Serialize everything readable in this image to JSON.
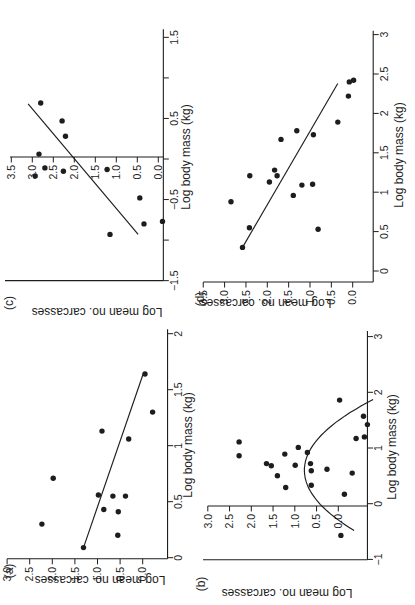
{
  "figure": {
    "background": "#ffffff",
    "ink": "#1d1d1d",
    "panels_order": [
      "a",
      "b",
      "c",
      "d"
    ]
  },
  "chart_data": [
    {
      "id": "a",
      "type": "scatter",
      "panel_label": "(a)",
      "xlabel": "Log body mass (kg)",
      "ylabel": "Log mean no. carcasses",
      "xlim": [
        -0.01,
        2.04
      ],
      "ylim": [
        -0.55,
        3.0
      ],
      "x_axis_at_y": -0.55,
      "y_axis_at_x": -0.01,
      "x_ticks": [
        0,
        0.5,
        1,
        1.5,
        2
      ],
      "x_tick_labels": [
        "0",
        "0.5",
        "1",
        "1.5",
        "2"
      ],
      "y_ticks": [
        0,
        0.5,
        1,
        1.5,
        2,
        2.5,
        3
      ],
      "y_tick_labels": [
        "0.0",
        "0.5",
        "1.0",
        "1.5",
        "2.0",
        "2.5",
        "3.0"
      ],
      "points": [
        [
          1.64,
          -0.05
        ],
        [
          1.3,
          -0.22
        ],
        [
          1.13,
          0.9
        ],
        [
          1.06,
          0.31
        ],
        [
          0.71,
          1.98
        ],
        [
          0.56,
          0.98
        ],
        [
          0.55,
          0.66
        ],
        [
          0.55,
          0.38
        ],
        [
          0.43,
          0.86
        ],
        [
          0.41,
          0.54
        ],
        [
          0.3,
          2.23
        ],
        [
          0.2,
          0.55
        ],
        [
          0.09,
          1.31
        ]
      ],
      "fit": {
        "kind": "line",
        "x1": 0.09,
        "y1": 1.31,
        "x2": 1.64,
        "y2": -0.01
      },
      "cal": {
        "x0": 47.3,
        "xs": 112.0,
        "y0": 142.7,
        "ys": 45.2
      },
      "label_px": [
        34,
        9
      ],
      "xlabel_px": [
        160,
        188
      ],
      "ylabel_px": [
        29,
        100
      ]
    },
    {
      "id": "b",
      "type": "scatter",
      "panel_label": "(b)",
      "xlabel": "Log body mass (kg)",
      "ylabel": "Log mean no. carcasses",
      "xlim": [
        -1.005,
        3.1
      ],
      "ylim": [
        -0.67,
        3.0
      ],
      "x_axis_at_y": -0.67,
      "y_axis_at_x": -0.04,
      "extra_spine": {
        "x": -1.005,
        "y1": -0.67,
        "y2": 3.11
      },
      "x_ticks": [
        -1,
        0,
        1,
        2,
        3
      ],
      "x_tick_labels": [
        "−1",
        "0",
        "1",
        "2",
        "3"
      ],
      "y_ticks": [
        0,
        0.5,
        1,
        1.5,
        2,
        2.5,
        3
      ],
      "y_tick_labels": [
        "0.0",
        "0.5",
        "1.0",
        "1.5",
        "2.0",
        "2.5",
        "3.0"
      ],
      "points": [
        [
          1.86,
          -0.03
        ],
        [
          1.57,
          -0.58
        ],
        [
          1.42,
          -0.67
        ],
        [
          1.2,
          -0.6
        ],
        [
          1.17,
          -0.41
        ],
        [
          1.11,
          2.28
        ],
        [
          0.86,
          2.28
        ],
        [
          1.01,
          0.92
        ],
        [
          0.89,
          1.23
        ],
        [
          0.92,
          0.71
        ],
        [
          0.72,
          1.65
        ],
        [
          0.68,
          1.54
        ],
        [
          0.69,
          0.99
        ],
        [
          0.72,
          0.64
        ],
        [
          0.59,
          0.62
        ],
        [
          0.62,
          0.26
        ],
        [
          0.5,
          1.4
        ],
        [
          0.55,
          -0.32
        ],
        [
          0.33,
          0.62
        ],
        [
          0.29,
          1.21
        ],
        [
          0.17,
          -0.14
        ],
        [
          -0.57,
          -0.06
        ]
      ],
      "fit": {
        "kind": "parabola",
        "qa": -0.98,
        "qh": 0.6,
        "qk": 0.78,
        "x_start": -0.48,
        "x_end": 1.87
      },
      "cal": {
        "x0": 101.3,
        "xs": 55.7,
        "y0": 338.3,
        "ys": 43.5
      },
      "label_px": [
        21,
        201
      ],
      "xlabel_px": [
        158,
        392
      ],
      "ylabel_px": [
        16,
        287
      ]
    },
    {
      "id": "c",
      "type": "scatter",
      "panel_label": "(c)",
      "xlabel": "Log body mass (kg)",
      "ylabel": "Log mean no. carcasses",
      "xlim": [
        -1.5,
        1.6
      ],
      "ylim": [
        -0.12,
        3.53
      ],
      "x_axis_at_y": -0.12,
      "y_axis_at_x": 0.025,
      "extra_spine": {
        "x": -1.5,
        "y1": -0.12,
        "y2": 3.65
      },
      "x_ticks": [
        -1.5,
        -1,
        -0.5,
        0,
        0.5,
        1,
        1.5
      ],
      "x_tick_labels": [
        "−1.5",
        "",
        "−0.5",
        "",
        "0.5",
        "",
        "1.5"
      ],
      "y_ticks": [
        0,
        0.5,
        1,
        1.5,
        2,
        2.5,
        3,
        3.5
      ],
      "y_tick_labels": [
        "0.0",
        "0.5",
        "1.0",
        "1.5",
        "2.0",
        "2.5",
        "3.0",
        "3.5"
      ],
      "points": [
        [
          0.69,
          2.8
        ],
        [
          0.47,
          2.29
        ],
        [
          0.28,
          2.21
        ],
        [
          0.06,
          2.84
        ],
        [
          -0.21,
          2.93
        ],
        [
          -0.11,
          2.7
        ],
        [
          -0.15,
          2.26
        ],
        [
          -0.13,
          1.22
        ],
        [
          -0.48,
          0.44
        ],
        [
          -0.93,
          1.15
        ],
        [
          -0.8,
          0.34
        ],
        [
          -0.77,
          -0.1
        ]
      ],
      "fit": {
        "kind": "line",
        "x1": -0.93,
        "y1": 0.48,
        "x2": 0.68,
        "y2": 3.1
      },
      "cal": {
        "x0": 446.0,
        "xs": 81.1,
        "y0": 158.3,
        "ys": 42.0
      },
      "label_px": [
        302,
        9
      ],
      "xlabel_px": [
        448,
        186
      ],
      "ylabel_px": [
        297,
        97
      ]
    },
    {
      "id": "d",
      "type": "scatter",
      "panel_label": "(d)",
      "xlabel": "Log body mass (kg)",
      "ylabel": "Log mean no. carcasses",
      "xlim": [
        -0.14,
        3.05
      ],
      "ylim": [
        -0.48,
        3.5
      ],
      "x_axis_at_y": -0.48,
      "y_axis_at_x": -0.14,
      "x_ticks": [
        0,
        0.5,
        1,
        1.5,
        2,
        2.5,
        3
      ],
      "x_tick_labels": [
        "0",
        "0.5",
        "1",
        "1.5",
        "2",
        "2.5",
        "3"
      ],
      "y_ticks": [
        0,
        0.5,
        1,
        1.5,
        2,
        2.5,
        3,
        3.5
      ],
      "y_tick_labels": [
        "0.0",
        "0.5",
        "1.0",
        "1.5",
        "2.0",
        "2.5",
        "3.0",
        "3.5"
      ],
      "points": [
        [
          2.4,
          0.08
        ],
        [
          2.42,
          -0.02
        ],
        [
          2.22,
          0.1
        ],
        [
          1.89,
          0.35
        ],
        [
          1.78,
          1.31
        ],
        [
          1.73,
          0.92
        ],
        [
          1.67,
          1.68
        ],
        [
          1.28,
          1.83
        ],
        [
          1.21,
          1.77
        ],
        [
          1.21,
          2.41
        ],
        [
          1.13,
          1.95
        ],
        [
          1.09,
          1.19
        ],
        [
          1.1,
          0.94
        ],
        [
          0.96,
          1.39
        ],
        [
          0.88,
          2.85
        ],
        [
          0.55,
          2.42
        ],
        [
          0.53,
          0.81
        ],
        [
          0.3,
          2.58
        ]
      ],
      "fit": {
        "kind": "line",
        "x1": 0.3,
        "y1": 2.58,
        "x2": 2.38,
        "y2": 0.35
      },
      "cal": {
        "x0": 334.0,
        "xs": 78.8,
        "y0": 352.7,
        "ys": 42.7
      },
      "label_px": [
        306,
        200
      ],
      "xlabel_px": [
        450,
        399
      ],
      "ylabel_px": [
        306,
        266
      ]
    }
  ]
}
